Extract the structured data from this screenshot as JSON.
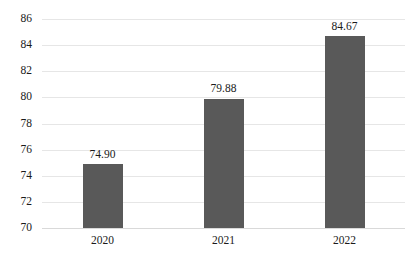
{
  "chart_data": {
    "type": "bar",
    "title": "",
    "subtitle": "",
    "xlabel": "",
    "ylabel": "",
    "categories": [
      "2020",
      "2021",
      "2022"
    ],
    "values": [
      74.9,
      84.67,
      79.88
    ],
    "data_labels": [
      "74.90",
      "79.88",
      "84.67"
    ],
    "series": [
      {
        "name": "",
        "values": [
          74.9,
          79.88,
          84.67
        ]
      }
    ],
    "ylim": [
      70,
      86
    ],
    "ytick_step": 2,
    "ytick_labels": [
      "86",
      "84",
      "82",
      "80",
      "78",
      "76",
      "74",
      "72",
      "70"
    ],
    "ytick_values": [
      86,
      84,
      82,
      80,
      78,
      76,
      74,
      72,
      70
    ],
    "grid": true,
    "grid_axis": "y",
    "legend": false,
    "legend_position": "none",
    "annotations": []
  },
  "style": {
    "bar_color": "#595959",
    "gridline_color": "#e6e6e6",
    "baseline_color": "#d9d9d9",
    "text_color": "#1a1a1a",
    "background": "#ffffff"
  }
}
